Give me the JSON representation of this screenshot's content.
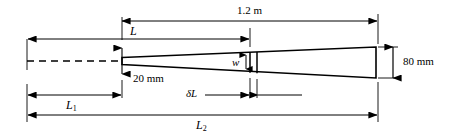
{
  "figure": {
    "kind": "engineering-diagram",
    "line_color": "#000000",
    "background_color": "#ffffff"
  },
  "labels": {
    "overall_length": "1.2 m",
    "length_L": "L",
    "length_L1_base": "L",
    "length_L1_sub": "1",
    "length_L2_base": "L",
    "length_L2_sub": "2",
    "depth_small": "20 mm",
    "depth_large": "80 mm",
    "element_width": "w",
    "element_length_base": "δL",
    "element_length": "δL"
  },
  "dimensions": [
    {
      "name": "overall-length",
      "label": "1.2 m",
      "position": "top"
    },
    {
      "name": "length-L",
      "label": "L",
      "position": "upper"
    },
    {
      "name": "length-L1",
      "label": "L₁",
      "position": "lower"
    },
    {
      "name": "length-L2",
      "label": "L₂",
      "position": "bottom"
    },
    {
      "name": "depth-left",
      "label": "20 mm",
      "position": "left-end"
    },
    {
      "name": "depth-right",
      "label": "80 mm",
      "position": "right-end"
    },
    {
      "name": "element-depth",
      "label": "w",
      "position": "middle"
    },
    {
      "name": "element-length",
      "label": "δL",
      "position": "middle-lower"
    }
  ]
}
